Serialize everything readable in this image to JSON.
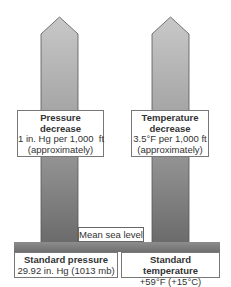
{
  "diagram": {
    "type": "two upward arrows showing atmospheric decrease with altitude",
    "colors": {
      "arrow_top": "#c4c4c4",
      "arrow_bottom": "#6e6e6e",
      "ground": "#7a7a7a",
      "box_border": "#777777"
    },
    "pressure_arrow": {
      "title_line1": "Pressure",
      "title_line2": "decrease",
      "rate": "1 in. Hg per 1,000  ft",
      "note": "(approximately)"
    },
    "temperature_arrow": {
      "title_line1": "Temperature",
      "title_line2": "decrease",
      "rate": "3.5°F per 1,000 ft",
      "note": "(approximately)"
    },
    "sea_level_label": "Mean sea level",
    "standard_pressure": {
      "title": "Standard pressure",
      "value": "29.92 in. Hg (1013 mb)"
    },
    "standard_temperature": {
      "title": "Standard temperature",
      "value": "+59°F (+15°C)"
    }
  }
}
